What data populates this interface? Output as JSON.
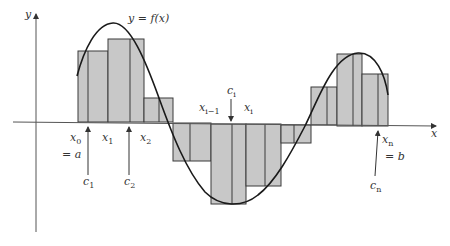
{
  "figure": {
    "curve_label": "y = f(x)",
    "axis_x_label": "x",
    "axis_y_label": "y",
    "colors": {
      "fill": "#c8c8c8",
      "stroke": "#3a3a3a",
      "axis": "#555555",
      "curve": "#1a1a1a",
      "text": "#333333"
    }
  },
  "labels": {
    "x0": {
      "base": "x",
      "sub": "0"
    },
    "eq_a": "= a",
    "x1": {
      "base": "x",
      "sub": "1"
    },
    "x2": {
      "base": "x",
      "sub": "2"
    },
    "c1": {
      "base": "c",
      "sub": "1"
    },
    "c2": {
      "base": "c",
      "sub": "2"
    },
    "ci": {
      "base": "c",
      "sub": "i"
    },
    "xim1": {
      "base": "x",
      "sub": "i−1"
    },
    "xi": {
      "base": "x",
      "sub": "i"
    },
    "xn": {
      "base": "x",
      "sub": "n"
    },
    "eq_b": "= b",
    "cn": {
      "base": "c",
      "sub": "n"
    }
  },
  "rectangles": [
    {
      "x0": 78,
      "x1": 108,
      "top": 51,
      "sample": 88,
      "sign": "positive"
    },
    {
      "x0": 108,
      "x1": 144,
      "top": 39,
      "sample": 130,
      "sign": "positive"
    },
    {
      "x0": 144,
      "x1": 173,
      "top": 98,
      "sample": 159,
      "sign": "positive"
    },
    {
      "x0": 173,
      "x1": 211,
      "top": 161,
      "sample": 190,
      "sign": "negative"
    },
    {
      "x0": 211,
      "x1": 246,
      "top": 204,
      "sample": 232,
      "sign": "negative"
    },
    {
      "x0": 246,
      "x1": 281,
      "top": 186,
      "sample": 265,
      "sign": "negative"
    },
    {
      "x0": 281,
      "x1": 311,
      "top": 143,
      "sample": 294,
      "sign": "negative"
    },
    {
      "x0": 311,
      "x1": 337,
      "top": 87,
      "sample": 327,
      "sign": "positive"
    },
    {
      "x0": 337,
      "x1": 362,
      "top": 54,
      "sample": 353,
      "sign": "positive"
    },
    {
      "x0": 362,
      "x1": 388,
      "top": 74,
      "sample": 378,
      "sign": "positive"
    }
  ]
}
